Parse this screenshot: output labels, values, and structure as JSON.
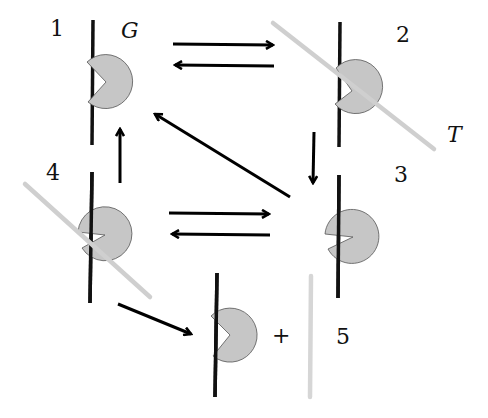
{
  "labels": {
    "state1": "1",
    "state2": "2",
    "state3": "3",
    "state4": "4",
    "state5": "5",
    "G": "G",
    "T": "T",
    "plus": "+"
  },
  "colors": {
    "pacman_fill": "#c6c6c6",
    "pacman_stroke": "#555555",
    "strand": "#111111",
    "trigger": "#d8d8d8",
    "arrow": "#000000"
  },
  "states": [
    {
      "id": 1,
      "strand_x": 93,
      "strand_y": [
        20,
        145
      ],
      "pac_cx": 106,
      "pac_cy": 82,
      "bound_trigger": false
    },
    {
      "id": 2,
      "strand_x": 340,
      "strand_y": [
        22,
        147
      ],
      "pac_cx": 359,
      "pac_cy": 85,
      "bound_trigger": true
    },
    {
      "id": 3,
      "strand_x": 339,
      "strand_y": [
        175,
        298
      ],
      "pac_cx": 354,
      "pac_cy": 237,
      "bound_trigger": false
    },
    {
      "id": 4,
      "strand_x": 91,
      "strand_y": [
        172,
        303
      ],
      "pac_cx": 104,
      "pac_cy": 234,
      "bound_trigger": true
    },
    {
      "id": 5,
      "strand_x": 216,
      "strand_y": [
        273,
        397
      ],
      "pac_cx": 231,
      "pac_cy": 335,
      "bound_trigger": false
    }
  ],
  "transitions": [
    {
      "from": 1,
      "to": 2
    },
    {
      "from": 2,
      "to": 1
    },
    {
      "from": 2,
      "to": 3
    },
    {
      "from": 3,
      "to": 1
    },
    {
      "from": 4,
      "to": 1
    },
    {
      "from": 4,
      "to": 3
    },
    {
      "from": 3,
      "to": 4
    },
    {
      "from": 4,
      "to": 5
    }
  ]
}
